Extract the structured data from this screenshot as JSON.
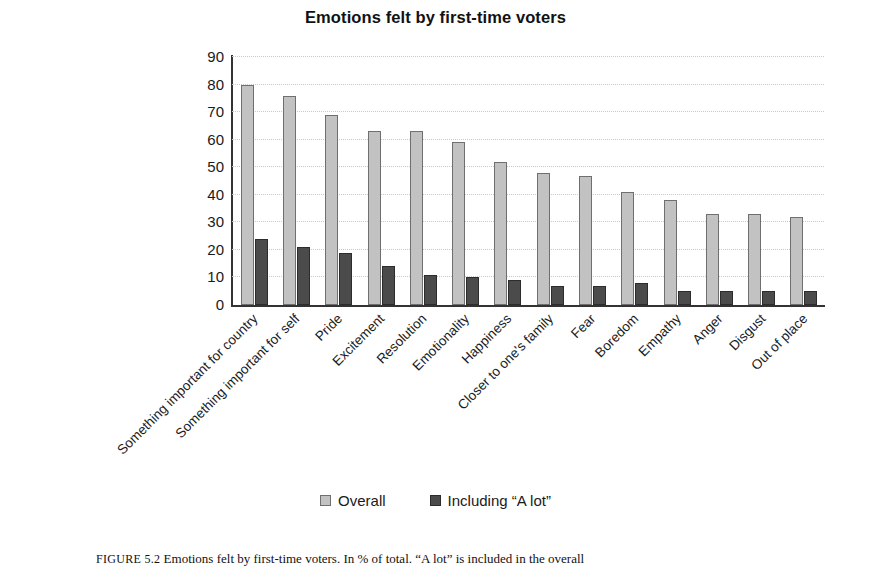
{
  "chart_data": {
    "type": "bar",
    "title": "Emotions felt by first-time voters",
    "xlabel": "",
    "ylabel": "",
    "ylim": [
      0,
      90
    ],
    "yticks": [
      0,
      10,
      20,
      30,
      40,
      50,
      60,
      70,
      80,
      90
    ],
    "grid": true,
    "legend_position": "bottom",
    "categories": [
      "Something important for country",
      "Something important for self",
      "Pride",
      "Excitement",
      "Resolution",
      "Emotionality",
      "Happiness",
      "Closer to one's family",
      "Fear",
      "Boredom",
      "Empathy",
      "Anger",
      "Disgust",
      "Out of place"
    ],
    "series": [
      {
        "name": "Overall",
        "color": "#c2c2c2",
        "values": [
          80,
          76,
          69,
          63,
          63,
          59,
          52,
          48,
          47,
          41,
          38,
          33,
          33,
          32
        ]
      },
      {
        "name": "Including “A lot”",
        "color": "#4b4b4b",
        "values": [
          24,
          21,
          19,
          14,
          11,
          10,
          9,
          7,
          7,
          8,
          5,
          5,
          5,
          5
        ]
      }
    ]
  },
  "caption": {
    "figure_number": "FIGURE 5.2",
    "text": "Emotions felt by first-time voters. In % of total. “A lot” is included in the overall"
  }
}
